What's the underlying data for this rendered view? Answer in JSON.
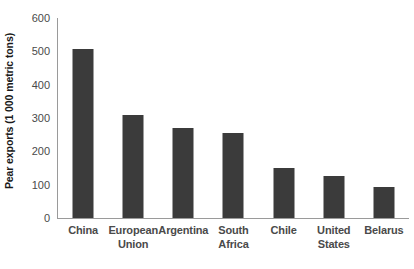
{
  "chart_data": {
    "type": "bar",
    "title": "",
    "subtitle": "",
    "xlabel": "",
    "ylabel": "Pear exports (1 000 metric tons)",
    "ylim": [
      0,
      600
    ],
    "ytick_labels": [
      "600",
      "500",
      "400",
      "300",
      "200",
      "100",
      "0"
    ],
    "ytick_values": [
      600,
      500,
      400,
      300,
      200,
      100,
      0
    ],
    "grid": false,
    "legend": null,
    "legend_position": "none",
    "bar_color": "#3b3b3b",
    "axis_color": "#9a9a9a",
    "background_color": "#ffffff",
    "categories": [
      "China",
      "European Union",
      "Argentina",
      "South Africa",
      "Chile",
      "United States",
      "Belarus"
    ],
    "category_lines": [
      [
        "China"
      ],
      [
        "European",
        "Union"
      ],
      [
        "Argentina"
      ],
      [
        "South",
        "Africa"
      ],
      [
        "Chile"
      ],
      [
        "United",
        "States"
      ],
      [
        "Belarus"
      ]
    ],
    "values": [
      507,
      308,
      270,
      255,
      150,
      125,
      92
    ]
  }
}
